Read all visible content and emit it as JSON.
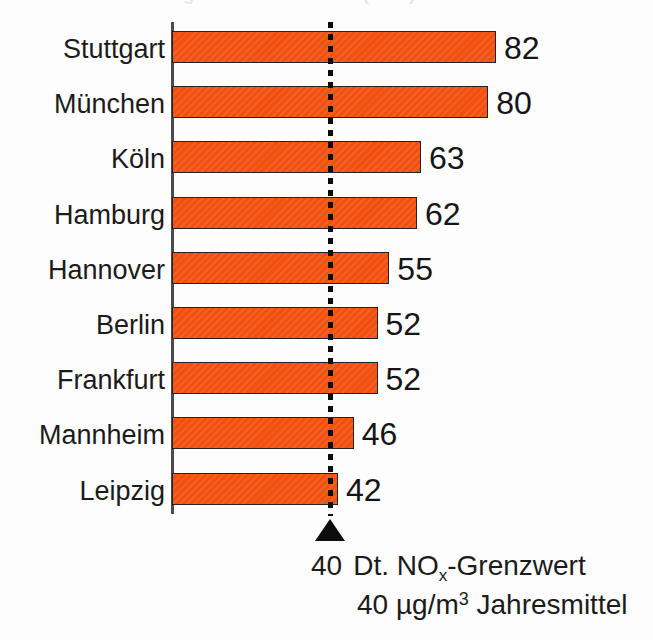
{
  "title_strip": {
    "text": "Stickoxid-Belastung deutscher Städte (NOx)",
    "note": "clipped headline at top edge"
  },
  "chart_data": {
    "type": "bar",
    "orientation": "horizontal",
    "title": "",
    "xlabel": "",
    "ylabel": "",
    "categories": [
      "Stuttgart",
      "München",
      "Köln",
      "Hamburg",
      "Hannover",
      "Berlin",
      "Frankfurt",
      "Mannheim",
      "Leipzig"
    ],
    "values": [
      82,
      80,
      63,
      62,
      55,
      52,
      52,
      46,
      42
    ],
    "value_labels": [
      "82",
      "80",
      "63",
      "62",
      "55",
      "52",
      "52",
      "46",
      "42"
    ],
    "xlim": [
      0,
      82
    ],
    "grid": false,
    "legend": null,
    "bar_color": "#f2500f",
    "bar_edge_color": "#232323",
    "threshold": {
      "value": 40,
      "label_value": "40",
      "line_style": "dotted",
      "color": "#0d0d0d",
      "marker": "triangle-up",
      "caption_line1_value": "40",
      "caption_line1_prefix": "Dt. NO",
      "caption_line1_sub": "x",
      "caption_line1_suffix": "-Grenzwert",
      "caption_line2": "40 µg/m",
      "caption_line2_sup": "3",
      "caption_line2_tail": " Jahresmittel"
    }
  }
}
